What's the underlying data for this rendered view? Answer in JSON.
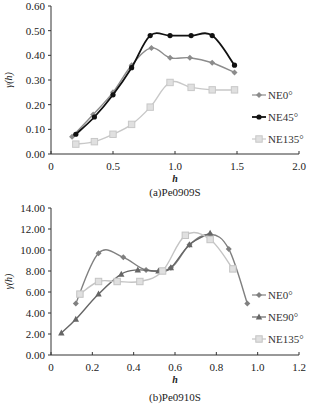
{
  "chart_data": [
    {
      "type": "line",
      "title": "",
      "caption": "(a)Pe0909S",
      "xlabel": "h",
      "ylabel": "γ(h)",
      "xlim": [
        0,
        2.0
      ],
      "ylim": [
        0,
        0.6
      ],
      "xticks": [
        "0",
        "0.5",
        "1.0",
        "1.5",
        "2.0"
      ],
      "yticks": [
        "0.00",
        "0.10",
        "0.20",
        "0.30",
        "0.40",
        "0.50",
        "0.60"
      ],
      "grid": false,
      "legend_position": "right",
      "series": [
        {
          "name": "NE0°",
          "color": "#8c8c8c",
          "marker": "diamond",
          "x": [
            0.17,
            0.34,
            0.5,
            0.65,
            0.81,
            0.96,
            1.12,
            1.3,
            1.48
          ],
          "y": [
            0.07,
            0.16,
            0.25,
            0.36,
            0.43,
            0.39,
            0.39,
            0.37,
            0.33
          ]
        },
        {
          "name": "NE45°",
          "color": "#111111",
          "marker": "circle",
          "x": [
            0.2,
            0.35,
            0.5,
            0.65,
            0.8,
            0.96,
            1.13,
            1.3,
            1.48
          ],
          "y": [
            0.08,
            0.15,
            0.24,
            0.35,
            0.48,
            0.48,
            0.48,
            0.48,
            0.36
          ]
        },
        {
          "name": "NE135°",
          "color": "#c8c8c8",
          "marker": "square",
          "x": [
            0.2,
            0.35,
            0.5,
            0.65,
            0.8,
            0.96,
            1.13,
            1.3,
            1.48
          ],
          "y": [
            0.04,
            0.05,
            0.08,
            0.12,
            0.19,
            0.29,
            0.27,
            0.26,
            0.26
          ]
        }
      ]
    },
    {
      "type": "line",
      "title": "",
      "caption": "(b)Pe0910S",
      "xlabel": "h",
      "ylabel": "γ(h)",
      "xlim": [
        0,
        1.2
      ],
      "ylim": [
        0,
        14
      ],
      "xticks": [
        "0",
        "0.2",
        "0.4",
        "0.6",
        "0.8",
        "1.0",
        "1.2"
      ],
      "yticks": [
        "0.00",
        "2.00",
        "4.00",
        "6.00",
        "8.00",
        "10.00",
        "12.00",
        "14.00"
      ],
      "grid": false,
      "legend_position": "right",
      "series": [
        {
          "name": "NE0°",
          "color": "#808080",
          "marker": "diamond",
          "x": [
            0.12,
            0.23,
            0.35,
            0.46,
            0.58,
            0.67,
            0.77,
            0.86,
            0.95
          ],
          "y": [
            4.9,
            9.7,
            9.3,
            8.1,
            8.3,
            10.5,
            11.5,
            10.1,
            4.9
          ]
        },
        {
          "name": "NE90°",
          "color": "#666666",
          "marker": "triangle",
          "x": [
            0.05,
            0.12,
            0.23,
            0.34,
            0.42,
            0.52,
            0.58,
            0.67,
            0.77
          ],
          "y": [
            2.1,
            3.4,
            5.8,
            7.7,
            8.1,
            8.0,
            8.3,
            10.5,
            11.6
          ]
        },
        {
          "name": "NE135°",
          "color": "#c4c4c4",
          "marker": "square",
          "x": [
            0.14,
            0.23,
            0.32,
            0.43,
            0.54,
            0.65,
            0.77,
            0.88
          ],
          "y": [
            5.8,
            7.0,
            7.0,
            7.0,
            8.0,
            11.4,
            11.0,
            8.2
          ]
        }
      ]
    }
  ]
}
